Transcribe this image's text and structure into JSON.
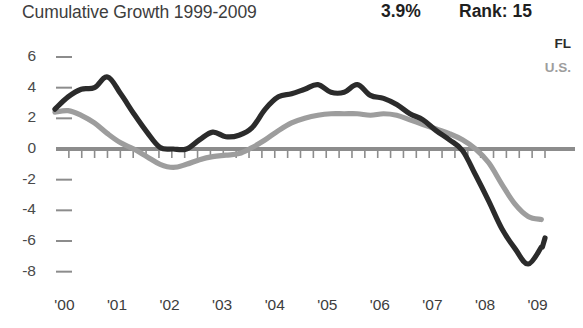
{
  "header": {
    "title": "Cumulative Growth 1999-2009",
    "value": "3.9%",
    "rank": "Rank: 15"
  },
  "legend": {
    "position": "top-right",
    "entries": [
      {
        "label": "FL",
        "color": "#2b2b2b"
      },
      {
        "label": "U.S.",
        "color": "#9d9d9d"
      }
    ]
  },
  "colors": {
    "fl_line": "#2b2b2b",
    "us_line": "#9d9d9d",
    "axis": "#8c8c8c",
    "text": "#3d3d3d"
  },
  "chart_data": {
    "type": "line",
    "title": "Cumulative Growth 1999-2009",
    "xlabel": "",
    "ylabel": "",
    "ylim": [
      -8,
      6
    ],
    "xlim": [
      1999.9,
      2009.2
    ],
    "grid": false,
    "legend_position": "top-right",
    "ytick_labels": [
      "6",
      "4",
      "2",
      "0",
      "-2",
      "-4",
      "-6",
      "-8"
    ],
    "ytick_values": [
      6,
      4,
      2,
      0,
      -2,
      -4,
      -6,
      -8
    ],
    "xtick_labels": [
      "'00",
      "'01",
      "'02",
      "'03",
      "'04",
      "'05",
      "'06",
      "'07",
      "'08",
      "'09"
    ],
    "xtick_values": [
      2000,
      2001,
      2002,
      2003,
      2004,
      2005,
      2006,
      2007,
      2008,
      2009
    ],
    "annotations": [
      {
        "text": "3.9%",
        "role": "headline-value"
      },
      {
        "text": "Rank: 15",
        "role": "headline-rank"
      }
    ],
    "x": [
      1999.88,
      2000.13,
      2000.38,
      2000.63,
      2000.88,
      2001.13,
      2001.38,
      2001.63,
      2001.88,
      2002.13,
      2002.38,
      2002.63,
      2002.88,
      2003.13,
      2003.38,
      2003.63,
      2003.88,
      2004.13,
      2004.38,
      2004.63,
      2004.88,
      2005.13,
      2005.38,
      2005.63,
      2005.88,
      2006.13,
      2006.38,
      2006.63,
      2006.88,
      2007.13,
      2007.38,
      2007.63,
      2007.88,
      2008.13,
      2008.38,
      2008.63,
      2008.88,
      2009.13
    ],
    "series": [
      {
        "name": "FL",
        "color": "#2b2b2b",
        "values": [
          2.6,
          3.4,
          3.9,
          4.0,
          4.7,
          3.6,
          2.3,
          1.1,
          0.1,
          0.0,
          0.0,
          0.6,
          1.1,
          0.8,
          0.9,
          1.4,
          2.6,
          3.4,
          3.6,
          3.9,
          4.2,
          3.7,
          3.7,
          4.2,
          3.5,
          3.3,
          2.9,
          2.3,
          1.9,
          1.2,
          0.6,
          -0.1,
          -1.7,
          -3.4,
          -5.2,
          -6.5,
          -7.5,
          -6.4
        ],
        "end_values": [
          -6.4,
          -6.4,
          -5.8
        ]
      },
      {
        "name": "U.S.",
        "color": "#9d9d9d",
        "values": [
          2.4,
          2.5,
          2.2,
          1.7,
          1.0,
          0.4,
          0.0,
          -0.5,
          -1.0,
          -1.2,
          -1.0,
          -0.7,
          -0.5,
          -0.4,
          -0.3,
          0.1,
          0.6,
          1.2,
          1.7,
          2.0,
          2.2,
          2.3,
          2.3,
          2.3,
          2.2,
          2.3,
          2.2,
          1.9,
          1.6,
          1.3,
          1.0,
          0.6,
          0.0,
          -0.9,
          -2.3,
          -3.6,
          -4.4,
          -4.6
        ]
      }
    ]
  }
}
